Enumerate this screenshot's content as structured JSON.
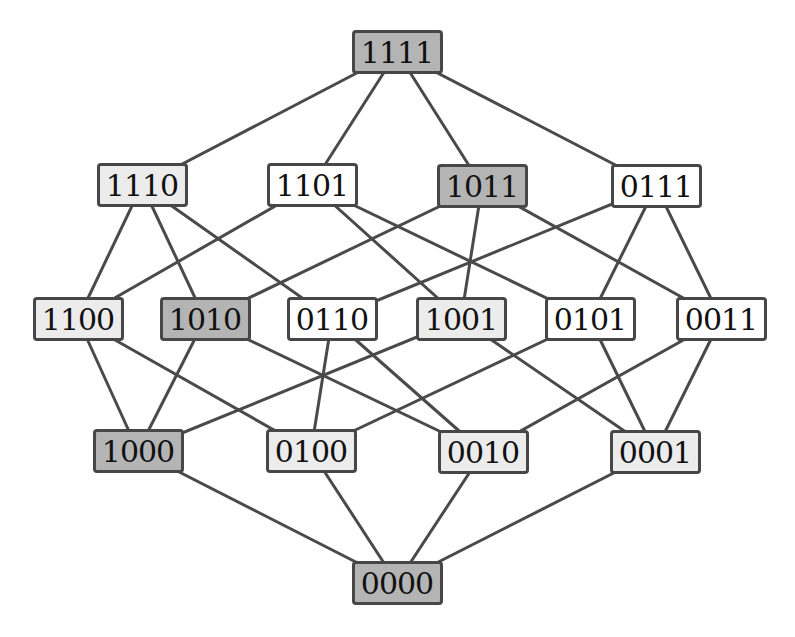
{
  "title": "",
  "colors": {
    "dark": "#b4b4b4",
    "light": "#ececec",
    "white": "#ffffff",
    "border": "#474747",
    "edge": "#4a4a4a"
  },
  "nodes": [
    {
      "id": "1111",
      "label": "1111",
      "shade": "dark",
      "x": 397,
      "y": 52
    },
    {
      "id": "1110",
      "label": "1110",
      "shade": "light",
      "x": 142,
      "y": 185
    },
    {
      "id": "1101",
      "label": "1101",
      "shade": "white",
      "x": 312,
      "y": 185
    },
    {
      "id": "1011",
      "label": "1011",
      "shade": "dark",
      "x": 482,
      "y": 186
    },
    {
      "id": "0111",
      "label": "0111",
      "shade": "white",
      "x": 656,
      "y": 186
    },
    {
      "id": "1100",
      "label": "1100",
      "shade": "light",
      "x": 78,
      "y": 319
    },
    {
      "id": "1010",
      "label": "1010",
      "shade": "dark",
      "x": 205,
      "y": 319
    },
    {
      "id": "0110",
      "label": "0110",
      "shade": "white",
      "x": 332,
      "y": 319
    },
    {
      "id": "1001",
      "label": "1001",
      "shade": "light",
      "x": 461,
      "y": 319
    },
    {
      "id": "0101",
      "label": "0101",
      "shade": "white",
      "x": 590,
      "y": 319
    },
    {
      "id": "0011",
      "label": "0011",
      "shade": "white",
      "x": 721,
      "y": 319
    },
    {
      "id": "1000",
      "label": "1000",
      "shade": "dark",
      "x": 138,
      "y": 451
    },
    {
      "id": "0100",
      "label": "0100",
      "shade": "light",
      "x": 311,
      "y": 451
    },
    {
      "id": "0010",
      "label": "0010",
      "shade": "light",
      "x": 483,
      "y": 452
    },
    {
      "id": "0001",
      "label": "0001",
      "shade": "light",
      "x": 655,
      "y": 452
    },
    {
      "id": "0000",
      "label": "0000",
      "shade": "dark",
      "x": 397,
      "y": 583
    }
  ],
  "edges": [
    [
      "1111",
      "1110"
    ],
    [
      "1111",
      "1101"
    ],
    [
      "1111",
      "1011"
    ],
    [
      "1111",
      "0111"
    ],
    [
      "1110",
      "1100"
    ],
    [
      "1110",
      "1010"
    ],
    [
      "1110",
      "0110"
    ],
    [
      "1101",
      "1100"
    ],
    [
      "1101",
      "1001"
    ],
    [
      "1101",
      "0101"
    ],
    [
      "1011",
      "1010"
    ],
    [
      "1011",
      "1001"
    ],
    [
      "1011",
      "0011"
    ],
    [
      "0111",
      "0110"
    ],
    [
      "0111",
      "0101"
    ],
    [
      "0111",
      "0011"
    ],
    [
      "1100",
      "1000"
    ],
    [
      "1100",
      "0100"
    ],
    [
      "1010",
      "1000"
    ],
    [
      "1010",
      "0010"
    ],
    [
      "0110",
      "0100"
    ],
    [
      "0110",
      "0010"
    ],
    [
      "1001",
      "1000"
    ],
    [
      "1001",
      "0001"
    ],
    [
      "0101",
      "0100"
    ],
    [
      "0101",
      "0001"
    ],
    [
      "0011",
      "0010"
    ],
    [
      "0011",
      "0001"
    ],
    [
      "1000",
      "0000"
    ],
    [
      "0100",
      "0000"
    ],
    [
      "0010",
      "0000"
    ],
    [
      "0001",
      "0000"
    ]
  ]
}
